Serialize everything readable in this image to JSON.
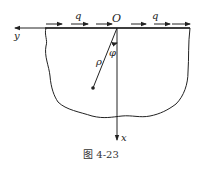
{
  "figure": {
    "caption": "图 4-23",
    "labels": {
      "origin": "O",
      "load_left": "q",
      "load_right": "q",
      "y_axis": "y",
      "x_axis": "x",
      "radius": "ρ",
      "angle": "φ"
    },
    "colors": {
      "stroke": "#222222",
      "background": "#ffffff"
    }
  }
}
